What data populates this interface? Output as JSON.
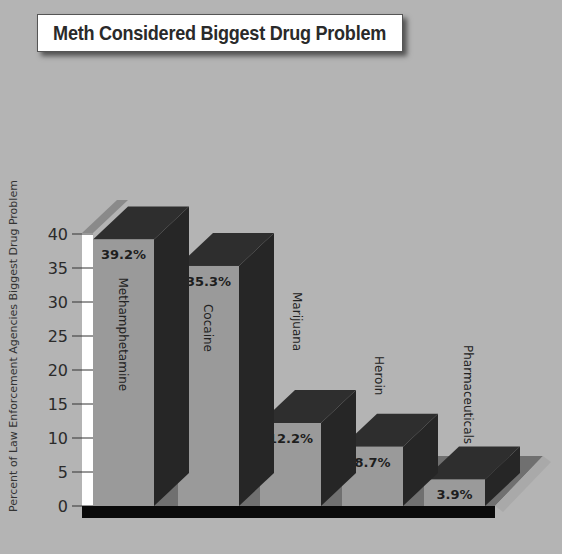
{
  "chart_data": {
    "type": "bar",
    "title": "Meth Considered Biggest Drug Problem",
    "xlabel": "",
    "ylabel": "Percent of Law Enforcement Agencies Biggest Drug Problem",
    "categories": [
      "Methamphetamine",
      "Cocaine",
      "Marijuana",
      "Heroin",
      "Pharmaceuticals"
    ],
    "values": [
      39.2,
      35.3,
      12.2,
      8.7,
      3.9
    ],
    "value_labels": [
      "39.2%",
      "35.3%",
      "12.2%",
      "8.7%",
      "3.9%"
    ],
    "ylim": [
      0,
      40
    ],
    "yticks": [
      "0",
      "5",
      "10",
      "15",
      "20",
      "25",
      "30",
      "35",
      "40"
    ],
    "grid": false,
    "legend": null,
    "style": "3d-bar"
  },
  "colors": {
    "background": "#b4b4b4",
    "bar_front": "#9a9a9a",
    "bar_top_side": "#2e2e2e",
    "base": "#0a0a0a",
    "floor": "#6e6e6e",
    "axis_strip": "#ffffff"
  }
}
